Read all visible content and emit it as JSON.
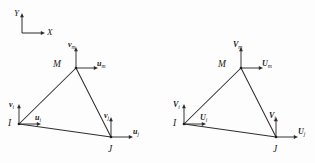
{
  "figure": {
    "type": "finite-element-triangular-element-displacement-diagram",
    "background_color": "#fdfdfd",
    "ink_color": "#2b2b2b",
    "width": 315,
    "height": 163
  },
  "global_axes": {
    "name": "reference-coordinate-axes",
    "origin": {
      "x": 22,
      "y": 33
    },
    "y_axis": {
      "label": "Y",
      "direction": "up",
      "length": 20,
      "label_x": 14,
      "label_y": 9
    },
    "x_axis": {
      "label": "X",
      "direction": "right",
      "length": 23,
      "label_x": 47,
      "label_y": 28
    }
  },
  "elements": [
    {
      "id": "left-element",
      "name": "local-displacement-element",
      "notation": "lowercase",
      "nodes": [
        {
          "id": "node-i",
          "label": "I",
          "label_x": 8,
          "label_y": 119,
          "x": 19,
          "y": 124,
          "vertical_displacement": {
            "symbol": "v",
            "subscript": "i",
            "label_x": 9,
            "label_y": 101,
            "arrow_len": 20
          },
          "horizontal_displacement": {
            "symbol": "u",
            "subscript": "i",
            "label_x": 35,
            "label_y": 114,
            "arrow_len": 22
          }
        },
        {
          "id": "node-j",
          "label": "J",
          "label_x": 108,
          "label_y": 145,
          "x": 111,
          "y": 137,
          "vertical_displacement": {
            "symbol": "v",
            "subscript": "j",
            "label_x": 104,
            "label_y": 112,
            "arrow_len": 20
          },
          "horizontal_displacement": {
            "symbol": "u",
            "subscript": "j",
            "label_x": 133,
            "label_y": 128,
            "arrow_len": 22
          }
        },
        {
          "id": "node-m",
          "label": "M",
          "label_x": 53,
          "label_y": 60,
          "x": 76,
          "y": 68,
          "vertical_displacement": {
            "symbol": "v",
            "subscript": "m",
            "label_x": 68,
            "label_y": 41,
            "arrow_len": 21
          },
          "horizontal_displacement": {
            "symbol": "u",
            "subscript": "m",
            "label_x": 97,
            "label_y": 60,
            "arrow_len": 22
          }
        }
      ]
    },
    {
      "id": "right-element",
      "name": "global-displacement-element",
      "notation": "uppercase",
      "nodes": [
        {
          "id": "node-i",
          "label": "I",
          "label_x": 173,
          "label_y": 119,
          "x": 184,
          "y": 124,
          "vertical_displacement": {
            "symbol": "V",
            "subscript": "i",
            "label_x": 173,
            "label_y": 101,
            "arrow_len": 20
          },
          "horizontal_displacement": {
            "symbol": "U",
            "subscript": "i",
            "label_x": 200,
            "label_y": 114,
            "arrow_len": 22
          }
        },
        {
          "id": "node-j",
          "label": "J",
          "label_x": 273,
          "label_y": 145,
          "x": 276,
          "y": 137,
          "vertical_displacement": {
            "symbol": "V",
            "subscript": "j",
            "label_x": 269,
            "label_y": 112,
            "arrow_len": 20
          },
          "horizontal_displacement": {
            "symbol": "U",
            "subscript": "j",
            "label_x": 298,
            "label_y": 128,
            "arrow_len": 22
          }
        },
        {
          "id": "node-m",
          "label": "M",
          "label_x": 218,
          "label_y": 60,
          "x": 241,
          "y": 68,
          "vertical_displacement": {
            "symbol": "V",
            "subscript": "m",
            "label_x": 233,
            "label_y": 41,
            "arrow_len": 21
          },
          "horizontal_displacement": {
            "symbol": "U",
            "subscript": "m",
            "label_x": 262,
            "label_y": 60,
            "arrow_len": 22
          }
        }
      ]
    }
  ]
}
